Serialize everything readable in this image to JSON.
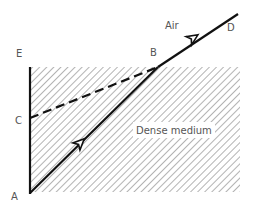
{
  "diagram": {
    "labels": {
      "air": "Air",
      "medium": "Dense medium",
      "A": "A",
      "B": "B",
      "C": "C",
      "D": "D",
      "E": "E"
    },
    "colors": {
      "line": "#111111",
      "hatch": "#8a8a8a",
      "label": "#555555",
      "background": "#ffffff"
    },
    "points": {
      "A": [
        30,
        193
      ],
      "B": [
        158,
        67
      ],
      "C": [
        30,
        118
      ],
      "D": [
        238,
        14
      ],
      "E": [
        30,
        67
      ]
    },
    "rays": [
      {
        "from": "A",
        "to": "B",
        "style": "solid",
        "arrow": true
      },
      {
        "from": "B",
        "to": "D",
        "style": "solid",
        "arrow": true
      },
      {
        "from": "C",
        "to": "B",
        "style": "dashed",
        "arrow": false
      },
      {
        "from": "E",
        "to": "A",
        "style": "solid",
        "arrow": false
      }
    ]
  }
}
